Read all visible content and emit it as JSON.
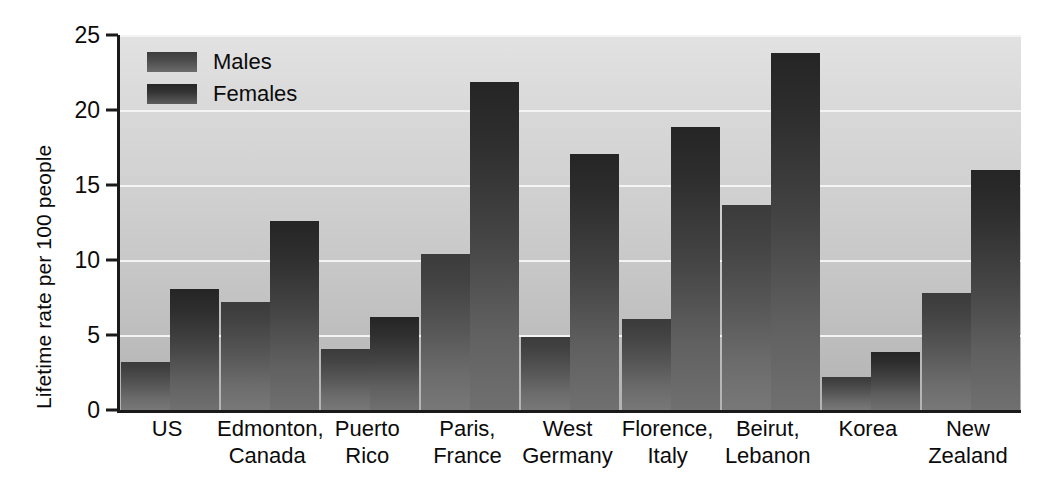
{
  "chart_data": {
    "type": "bar",
    "title": "",
    "subtitle": "",
    "xlabel": "",
    "ylabel": "Lifetime rate per 100 people",
    "ylim": [
      0,
      25
    ],
    "yticks": [
      0,
      5,
      10,
      15,
      20,
      25
    ],
    "ytick_labels": [
      "0",
      "5",
      "10",
      "15",
      "20",
      "25"
    ],
    "grid": true,
    "grid_orientation": "horizontal",
    "legend_position": "top-left",
    "categories": [
      "US",
      "Edmonton, Canada",
      "Puerto Rico",
      "Paris, France",
      "West Germany",
      "Florence, Italy",
      "Beirut, Lebanon",
      "Korea",
      "New Zealand"
    ],
    "category_lines": [
      [
        "US"
      ],
      [
        "Edmonton,",
        "Canada"
      ],
      [
        "Puerto",
        "Rico"
      ],
      [
        "Paris,",
        "France"
      ],
      [
        "West",
        "Germany"
      ],
      [
        "Florence,",
        "Italy"
      ],
      [
        "Beirut,",
        "Lebanon"
      ],
      [
        "Korea"
      ],
      [
        "New",
        "Zealand"
      ]
    ],
    "series": [
      {
        "name": "Males",
        "color": "#4b4b4b",
        "values": [
          3.2,
          7.2,
          4.1,
          10.4,
          4.9,
          6.1,
          13.7,
          2.2,
          7.8
        ]
      },
      {
        "name": "Females",
        "color": "#2e2e2e",
        "values": [
          8.1,
          12.6,
          6.2,
          21.9,
          17.1,
          18.9,
          23.8,
          3.9,
          16.0
        ]
      }
    ]
  },
  "legend": {
    "items": [
      {
        "label": "Males"
      },
      {
        "label": "Females"
      }
    ]
  },
  "colors": {
    "plot_background_top": "#e2e2e2",
    "plot_background_bottom": "#b3b3b3",
    "gridline": "#f4f4f4",
    "axis": "#1a1a1a",
    "text": "#0b0b0b",
    "males_bar": "#4b4b4b",
    "females_bar": "#2e2e2e"
  }
}
